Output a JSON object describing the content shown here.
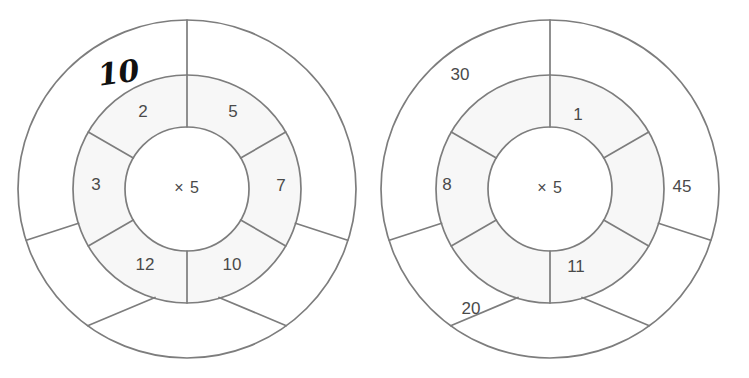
{
  "worksheet": {
    "title": "Multiplication Wheels",
    "background_color": "#ffffff",
    "stroke_color": "#7d7d7d",
    "ring_fill_color": "#f7f7f7",
    "number_text_color": "#4a4a4a",
    "handwriting_color": "#111111"
  },
  "wheels": [
    {
      "id": "wheel-left",
      "center_label": "× 5",
      "center": {
        "cx": 187,
        "cy": 189
      },
      "radii": {
        "inner": 62,
        "middle": 114,
        "outer": 169
      },
      "segments": 5,
      "middle_ring": [
        {
          "position": "top-left",
          "angle_deg": 324,
          "value": "2"
        },
        {
          "position": "top-right",
          "angle_deg": 36,
          "value": "5"
        },
        {
          "position": "right",
          "angle_deg": 90,
          "value": "7"
        },
        {
          "position": "bottom-right",
          "angle_deg": 144,
          "value": "10"
        },
        {
          "position": "bottom-left",
          "angle_deg": 216,
          "value": "12"
        },
        {
          "position": "left",
          "angle_deg": 270,
          "value": "3"
        }
      ],
      "outer_ring": [
        {
          "position": "top-left",
          "angle_deg": 324,
          "value": "10",
          "handwritten": true
        }
      ]
    },
    {
      "id": "wheel-right",
      "center_label": "× 5",
      "center": {
        "cx": 187,
        "cy": 189
      },
      "radii": {
        "inner": 62,
        "middle": 114,
        "outer": 169
      },
      "segments": 5,
      "middle_ring": [
        {
          "position": "top-right",
          "angle_deg": 36,
          "value": "1"
        },
        {
          "position": "bottom-right",
          "angle_deg": 144,
          "value": "11"
        },
        {
          "position": "left",
          "angle_deg": 270,
          "value": "8"
        }
      ],
      "outer_ring": [
        {
          "position": "top-left",
          "angle_deg": 324,
          "value": "30",
          "handwritten": false
        },
        {
          "position": "right",
          "angle_deg": 90,
          "value": "45",
          "handwritten": false
        },
        {
          "position": "bottom-left",
          "angle_deg": 216,
          "value": "20",
          "handwritten": false
        }
      ]
    }
  ],
  "labels": {
    "left_mid_2": "2",
    "left_mid_5": "5",
    "left_mid_7": "7",
    "left_mid_10": "10",
    "left_mid_12": "12",
    "left_mid_3": "3",
    "left_outer_10": "10",
    "left_center": "× 5",
    "right_mid_1": "1",
    "right_mid_11": "11",
    "right_mid_8": "8",
    "right_outer_30": "30",
    "right_outer_45": "45",
    "right_outer_20": "20",
    "right_center": "× 5"
  }
}
